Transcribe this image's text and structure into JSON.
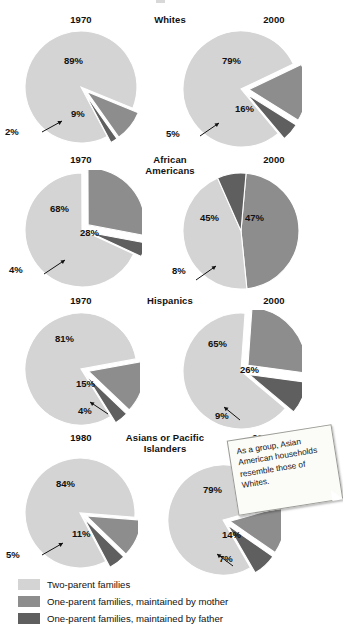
{
  "figure": {
    "note": {
      "text": "As a group, Asian American households resemble those of Whites."
    }
  },
  "legend": {
    "items": [
      {
        "label": "Two-parent families",
        "color": "#d4d4d4"
      },
      {
        "label": "One-parent families, maintained by mother",
        "color": "#8d8d8d"
      },
      {
        "label": "One-parent families, maintained by father",
        "color": "#5f5f5f"
      }
    ]
  },
  "chart_data": {
    "type": "pie",
    "title": "",
    "legend_position": "bottom",
    "series_names": [
      "Two-parent families",
      "One-parent families, maintained by mother",
      "One-parent families, maintained by father"
    ],
    "colors": [
      "#d4d4d4",
      "#8d8d8d",
      "#5f5f5f"
    ],
    "groups": [
      {
        "group": "Whites",
        "panels": [
          {
            "year": "1970",
            "values": [
              89,
              9,
              2
            ],
            "labels": [
              "89%",
              "9%",
              "2%"
            ]
          },
          {
            "year": "2000",
            "values": [
              79,
              16,
              5
            ],
            "labels": [
              "79%",
              "16%",
              "5%"
            ]
          }
        ]
      },
      {
        "group": "African Americans",
        "panels": [
          {
            "year": "1970",
            "values": [
              68,
              28,
              4
            ],
            "labels": [
              "68%",
              "28%",
              "4%"
            ]
          },
          {
            "year": "2000",
            "values": [
              45,
              47,
              8
            ],
            "labels": [
              "45%",
              "47%",
              "8%"
            ]
          }
        ]
      },
      {
        "group": "Hispanics",
        "panels": [
          {
            "year": "1970",
            "values": [
              81,
              15,
              4
            ],
            "labels": [
              "81%",
              "15%",
              "4%"
            ]
          },
          {
            "year": "2000",
            "values": [
              65,
              26,
              9
            ],
            "labels": [
              "65%",
              "26%",
              "9%"
            ]
          }
        ]
      },
      {
        "group": "Asians or Pacific Islanders",
        "panels": [
          {
            "year": "1980",
            "values": [
              84,
              11,
              5
            ],
            "labels": [
              "84%",
              "11%",
              "5%"
            ]
          },
          {
            "year": "2000",
            "values": [
              79,
              14,
              7
            ],
            "labels": [
              "79%",
              "14%",
              "7%"
            ]
          }
        ]
      }
    ]
  },
  "panels": {
    "whites_1970": {
      "year": "1970",
      "group_line1": "Whites",
      "group_line2": "",
      "l_two": "89%",
      "l_mom": "9%",
      "l_dad": "2%"
    },
    "whites_2000": {
      "year": "2000",
      "l_two": "79%",
      "l_mom": "16%",
      "l_dad": "5%"
    },
    "black_1970": {
      "year": "1970",
      "group_line1": "African",
      "group_line2": "Americans",
      "l_two": "68%",
      "l_mom": "28%",
      "l_dad": "4%"
    },
    "black_2000": {
      "year": "2000",
      "l_two": "45%",
      "l_mom": "47%",
      "l_dad": "8%"
    },
    "hisp_1970": {
      "year": "1970",
      "group_line1": "Hispanics",
      "group_line2": "",
      "l_two": "81%",
      "l_mom": "15%",
      "l_dad": "4%"
    },
    "hisp_2000": {
      "year": "2000",
      "l_two": "65%",
      "l_mom": "26%",
      "l_dad": "9%"
    },
    "asian_1980": {
      "year": "1980",
      "group_line1": "Asians or Pacific",
      "group_line2": "Islanders",
      "l_two": "84%",
      "l_mom": "11%",
      "l_dad": "5%"
    },
    "asian_2000": {
      "year": "2000",
      "l_two": "79%",
      "l_mom": "14%",
      "l_dad": "7%"
    }
  }
}
